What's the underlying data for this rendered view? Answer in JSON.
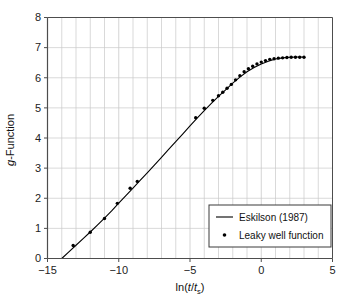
{
  "chart_data": {
    "type": "line",
    "title": "",
    "xlabel": "ln(t/ts)",
    "ylabel": "g-Function",
    "xlim": [
      -15,
      5
    ],
    "ylim": [
      0,
      8
    ],
    "grid": true,
    "x_major_ticks": [
      -15,
      -10,
      -5,
      0,
      5
    ],
    "x_major_tick_labels": [
      "-15",
      "-10",
      "-5",
      "0",
      "5"
    ],
    "x_minor_tick_step": 1,
    "y_major_ticks": [
      0,
      1,
      2,
      3,
      4,
      5,
      6,
      7,
      8
    ],
    "y_major_tick_labels": [
      "0",
      "1",
      "2",
      "3",
      "4",
      "5",
      "6",
      "7",
      "8"
    ],
    "legend_position": "lower right",
    "series": [
      {
        "name": "Eskilson (1987)",
        "marker": "line",
        "color": "#000000",
        "x": [
          -14.0,
          -13.5,
          -13.0,
          -12.5,
          -12.0,
          -11.5,
          -11.0,
          -10.5,
          -10.0,
          -9.5,
          -9.0,
          -8.5,
          -8.0,
          -7.5,
          -7.0,
          -6.5,
          -6.0,
          -5.5,
          -5.0,
          -4.5,
          -4.0,
          -3.5,
          -3.0,
          -2.5,
          -2.0,
          -1.5,
          -1.0,
          -0.5,
          0.0,
          0.5,
          1.0,
          1.5,
          2.0,
          2.5,
          3.0
        ],
        "y": [
          0.0,
          0.22,
          0.44,
          0.66,
          0.88,
          1.11,
          1.34,
          1.58,
          1.84,
          2.09,
          2.34,
          2.59,
          2.84,
          3.1,
          3.36,
          3.62,
          3.88,
          4.14,
          4.4,
          4.66,
          4.91,
          5.15,
          5.38,
          5.6,
          5.82,
          6.02,
          6.2,
          6.34,
          6.46,
          6.55,
          6.62,
          6.66,
          6.68,
          6.69,
          6.69
        ]
      },
      {
        "name": "Leaky well function",
        "marker": "dot",
        "color": "#000000",
        "x": [
          -13.2,
          -12.0,
          -11.0,
          -10.1,
          -9.2,
          -8.7,
          -4.6,
          -4.0,
          -3.4,
          -3.0,
          -2.7,
          -2.4,
          -2.1,
          -1.8,
          -1.5,
          -1.2,
          -0.9,
          -0.6,
          -0.3,
          0.0,
          0.3,
          0.6,
          0.9,
          1.2,
          1.5,
          1.8,
          2.1,
          2.4,
          2.7,
          3.0
        ],
        "y": [
          0.43,
          0.87,
          1.33,
          1.83,
          2.33,
          2.56,
          4.67,
          4.99,
          5.25,
          5.4,
          5.52,
          5.65,
          5.78,
          5.93,
          6.07,
          6.2,
          6.3,
          6.38,
          6.46,
          6.52,
          6.57,
          6.61,
          6.63,
          6.65,
          6.66,
          6.67,
          6.68,
          6.68,
          6.68,
          6.68
        ]
      }
    ]
  },
  "axes": {
    "y_title_prefix": "g",
    "y_title_suffix": "-Function",
    "x_title_parts": {
      "lead": "ln(",
      "t1": "t",
      "slash": "/",
      "t2": "t",
      "sub": "s",
      "close": ")"
    }
  },
  "legend": {
    "entries": [
      {
        "label": "Eskilson (1987)",
        "marker": "line"
      },
      {
        "label": "Leaky well function",
        "marker": "dot"
      }
    ]
  },
  "colors": {
    "axis": "#4d4d4d",
    "grid": "#c9c9c9",
    "curve": "#000000",
    "marker": "#000000",
    "text": "#1a1a1a",
    "legend_border": "#3a3a3a",
    "background": "#ffffff"
  }
}
